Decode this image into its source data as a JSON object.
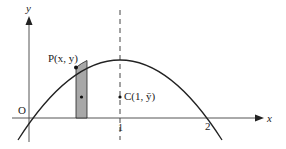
{
  "figure": {
    "title": "",
    "curve": "y = x(2 - x)",
    "colors": {
      "ink": "#222222",
      "axis": "#555555",
      "strip_fill": "#a8a8a8",
      "background": "#ffffff"
    },
    "axes": {
      "x_label": "x",
      "y_label": "y",
      "origin_label": "O",
      "x_ticks": [
        {
          "value": 1,
          "label": "1"
        },
        {
          "value": 2,
          "label": "2"
        }
      ]
    },
    "point_p": {
      "label": "P(x, y)"
    },
    "centroid": {
      "label": "C(1, ȳ)"
    },
    "dashed_line": {
      "x": 1
    },
    "strip": {
      "description": "vertical shaded strip under the curve at P"
    }
  }
}
